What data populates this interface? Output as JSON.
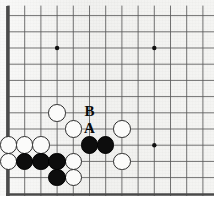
{
  "board": {
    "kind": "go-board-diagram",
    "origin_x": 8.5,
    "origin_y": 15.6,
    "spacing": 16.2,
    "cols": 13,
    "rows": 11,
    "line_color": "#5a5a5a",
    "edge_color": "#4a4a4a",
    "background_color": "#f1f1ef",
    "stone_diameter": 17.6,
    "star_point_radius": 2.2,
    "star_points": [
      {
        "col": 3,
        "row": 2
      },
      {
        "col": 9,
        "row": 2
      },
      {
        "col": 9,
        "row": 8
      }
    ],
    "edges": {
      "left_is_board_edge": true,
      "top_is_board_edge": false,
      "right_is_board_edge": false,
      "bottom_is_board_edge": false
    }
  },
  "stones": [
    {
      "color": "white",
      "col": 3,
      "row": 6
    },
    {
      "color": "white",
      "col": 4,
      "row": 7
    },
    {
      "color": "white",
      "col": 7,
      "row": 7
    },
    {
      "color": "white",
      "col": 0,
      "row": 8
    },
    {
      "color": "white",
      "col": 1,
      "row": 8
    },
    {
      "color": "white",
      "col": 2,
      "row": 8
    },
    {
      "color": "black",
      "col": 5,
      "row": 8
    },
    {
      "color": "black",
      "col": 6,
      "row": 8
    },
    {
      "color": "white",
      "col": 0,
      "row": 9
    },
    {
      "color": "black",
      "col": 1,
      "row": 9
    },
    {
      "color": "black",
      "col": 2,
      "row": 9
    },
    {
      "color": "black",
      "col": 3,
      "row": 9
    },
    {
      "color": "white",
      "col": 4,
      "row": 9
    },
    {
      "color": "white",
      "col": 7,
      "row": 9
    },
    {
      "color": "black",
      "col": 3,
      "row": 10
    },
    {
      "color": "white",
      "col": 4,
      "row": 10
    }
  ],
  "labels": [
    {
      "text": "B",
      "col": 5,
      "row": 6,
      "font_size": 15
    },
    {
      "text": "A",
      "col": 5,
      "row": 7,
      "font_size": 15
    }
  ],
  "legend": {
    "label_a": "A",
    "label_b": "B"
  }
}
